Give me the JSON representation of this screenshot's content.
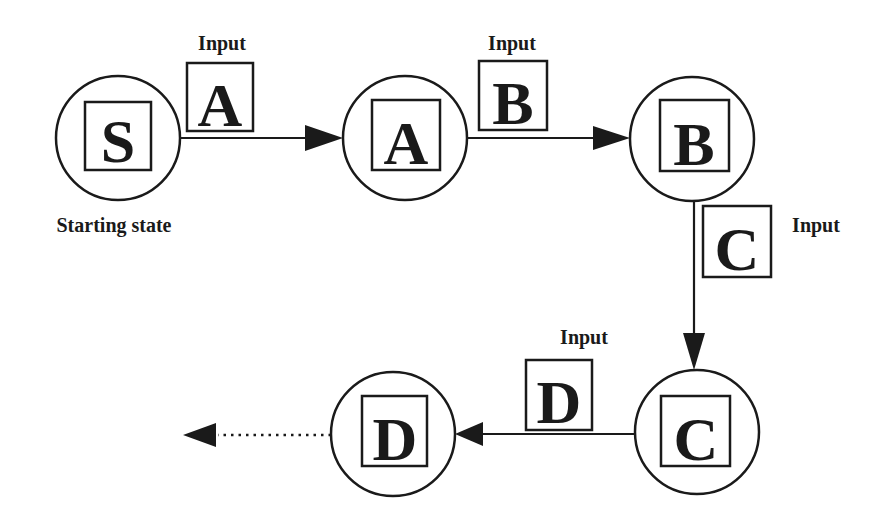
{
  "diagram": {
    "type": "state-transition",
    "colors": {
      "stroke": "#1a1a1a",
      "background": "#ffffff"
    },
    "states": [
      {
        "id": "S",
        "letter": "S",
        "caption": "Starting state"
      },
      {
        "id": "A",
        "letter": "A"
      },
      {
        "id": "B",
        "letter": "B"
      },
      {
        "id": "C",
        "letter": "C"
      },
      {
        "id": "D",
        "letter": "D"
      }
    ],
    "transitions": [
      {
        "from": "S",
        "to": "A",
        "input_label": "Input",
        "input_letter": "A"
      },
      {
        "from": "A",
        "to": "B",
        "input_label": "Input",
        "input_letter": "B"
      },
      {
        "from": "B",
        "to": "C",
        "input_label": "Input",
        "input_letter": "C"
      },
      {
        "from": "C",
        "to": "D",
        "input_label": "Input",
        "input_letter": "D"
      },
      {
        "from": "D",
        "to": "next",
        "style": "dotted"
      }
    ]
  }
}
